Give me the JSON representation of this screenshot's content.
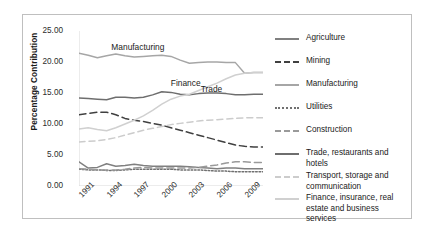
{
  "chart_data": {
    "type": "line",
    "title": "",
    "xlabel": "",
    "ylabel": "Percentage Contribution",
    "ylim": [
      0,
      25
    ],
    "ytick_labels": [
      "0.00",
      "5.00",
      "10.00",
      "15.00",
      "20.00",
      "25.00"
    ],
    "ytick_values": [
      0,
      5,
      10,
      15,
      20,
      25
    ],
    "xtick_labels": [
      "1991",
      "1994",
      "1997",
      "2000",
      "2003",
      "2006",
      "2009"
    ],
    "xtick_values": [
      1991,
      1994,
      1997,
      2000,
      2003,
      2006,
      2009
    ],
    "x": [
      1991,
      1992,
      1993,
      1994,
      1995,
      1996,
      1997,
      1998,
      1999,
      2000,
      2001,
      2002,
      2003,
      2004,
      2005,
      2006,
      2007,
      2008,
      2009,
      2010,
      2011
    ],
    "xlim": [
      1991,
      2011
    ],
    "grid": false,
    "legend_position": "right",
    "annotations": [
      {
        "text": "Manufacturing",
        "x": 1997.4,
        "y": 22.4
      },
      {
        "text": "Finance",
        "x": 2002.6,
        "y": 16.6
      },
      {
        "text": "Trade",
        "x": 2005.4,
        "y": 15.6
      }
    ],
    "series": [
      {
        "name": "Agriculture",
        "style": "solid",
        "color": "#808080",
        "values": [
          3.9,
          2.9,
          3.0,
          3.6,
          3.2,
          3.3,
          3.5,
          3.3,
          3.2,
          3.2,
          3.2,
          3.2,
          3.1,
          3.0,
          2.9,
          2.8,
          2.9,
          2.9,
          2.8,
          2.8,
          2.8
        ]
      },
      {
        "name": "Mining",
        "style": "dashed",
        "color": "#404040",
        "values": [
          11.5,
          11.7,
          11.9,
          11.9,
          11.5,
          10.9,
          10.6,
          10.4,
          10.1,
          9.8,
          9.4,
          9.0,
          8.6,
          8.2,
          7.8,
          7.4,
          7.0,
          6.6,
          6.4,
          6.3,
          6.3
        ]
      },
      {
        "name": "Manufacturing",
        "style": "solid",
        "color": "#a6a6a6",
        "values": [
          21.4,
          21.1,
          20.7,
          21.0,
          21.3,
          21.0,
          20.8,
          20.9,
          21.0,
          21.1,
          20.9,
          20.3,
          19.8,
          19.9,
          20.0,
          20.0,
          19.9,
          19.9,
          18.2,
          18.3,
          18.3
        ]
      },
      {
        "name": "Utilities",
        "style": "dotted",
        "color": "#707070",
        "values": [
          2.7,
          2.6,
          2.6,
          2.5,
          2.5,
          2.6,
          2.7,
          2.7,
          2.7,
          2.7,
          2.7,
          2.6,
          2.6,
          2.6,
          2.5,
          2.4,
          2.4,
          2.3,
          2.3,
          2.3,
          2.3
        ]
      },
      {
        "name": "Construction",
        "style": "dashed",
        "color": "#9a9a9a",
        "values": [
          2.8,
          2.7,
          2.6,
          2.6,
          2.6,
          2.7,
          2.9,
          3.0,
          2.9,
          2.9,
          2.9,
          2.9,
          2.9,
          3.0,
          3.2,
          3.4,
          3.7,
          3.9,
          3.9,
          3.8,
          3.8
        ]
      },
      {
        "name": "Trade, restaurants and hotels",
        "style": "solid",
        "color": "#6e6e6e",
        "values": [
          14.2,
          14.1,
          14.0,
          13.9,
          14.3,
          14.3,
          14.2,
          14.3,
          14.7,
          15.2,
          15.1,
          14.8,
          14.7,
          14.9,
          15.0,
          15.0,
          14.9,
          14.7,
          14.7,
          14.8,
          14.8
        ]
      },
      {
        "name": "Transport, storage and communication",
        "style": "dashed-light",
        "color": "#cccccc",
        "values": [
          7.1,
          7.2,
          7.3,
          7.5,
          7.8,
          8.2,
          8.6,
          9.0,
          9.3,
          9.6,
          9.9,
          10.1,
          10.3,
          10.5,
          10.6,
          10.7,
          10.8,
          10.9,
          11.0,
          11.0,
          11.0
        ]
      },
      {
        "name": "Finance, insurance, real estate and business services",
        "style": "solid",
        "color": "#d0d0d0",
        "values": [
          9.2,
          9.4,
          9.1,
          8.9,
          9.4,
          10.0,
          10.6,
          11.3,
          12.2,
          13.2,
          14.0,
          14.5,
          14.8,
          15.4,
          16.0,
          16.6,
          17.3,
          17.9,
          18.2,
          18.3,
          18.3
        ]
      }
    ]
  },
  "legend": {
    "items": [
      {
        "label": "Agriculture"
      },
      {
        "label": "Mining"
      },
      {
        "label": "Manufacturing"
      },
      {
        "label": "Utilities"
      },
      {
        "label": "Construction"
      },
      {
        "label": "Trade, restaurants and hotels"
      },
      {
        "label": "Transport, storage and\ncommunication"
      },
      {
        "label": "Finance, insurance, real\nestate and business services"
      }
    ]
  }
}
